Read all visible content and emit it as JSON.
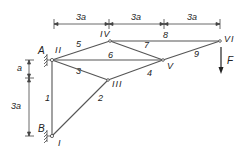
{
  "diagram": {
    "type": "truss",
    "dimensions": {
      "top": [
        "3a",
        "3a",
        "3a"
      ],
      "left": [
        "a",
        "3a"
      ]
    },
    "supports": [
      {
        "label": "A",
        "node": "II"
      },
      {
        "label": "B",
        "node": "I"
      }
    ],
    "nodes": [
      {
        "id": "I",
        "label": "I"
      },
      {
        "id": "II",
        "label": "II"
      },
      {
        "id": "III",
        "label": "III"
      },
      {
        "id": "IV",
        "label": "IV"
      },
      {
        "id": "V",
        "label": "V"
      },
      {
        "id": "VI",
        "label": "VI"
      }
    ],
    "members": [
      {
        "label": "1",
        "from": "I",
        "to": "II"
      },
      {
        "label": "2",
        "from": "I",
        "to": "III"
      },
      {
        "label": "3",
        "from": "II",
        "to": "III"
      },
      {
        "label": "4",
        "from": "III",
        "to": "V"
      },
      {
        "label": "5",
        "from": "II",
        "to": "IV"
      },
      {
        "label": "6",
        "from": "II",
        "to": "V"
      },
      {
        "label": "7",
        "from": "IV",
        "to": "V"
      },
      {
        "label": "8",
        "from": "IV",
        "to": "VI"
      },
      {
        "label": "9",
        "from": "V",
        "to": "VI"
      }
    ],
    "load": {
      "label": "F",
      "node": "VI",
      "direction": "down"
    }
  }
}
